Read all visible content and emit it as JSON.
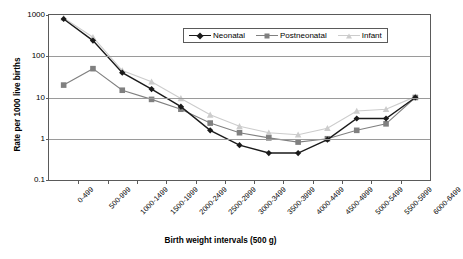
{
  "chart_data": {
    "type": "line",
    "title": "",
    "xlabel": "Birth weight intervals (500 g)",
    "ylabel": "Rate per 1000 live births",
    "yscale": "log",
    "ylim": [
      0.1,
      1000
    ],
    "yticks": [
      "1000",
      "100",
      "10",
      "1",
      "0.1"
    ],
    "ytick_values": [
      1000,
      100,
      10,
      1,
      0.1
    ],
    "grid": true,
    "legend_position": "top-center-inside",
    "categories": [
      "0-499",
      "500-999",
      "1000-1499",
      "1500-1999",
      "2000-2499",
      "2500-2999",
      "3000-3499",
      "3500-3999",
      "4000-4499",
      "4500-4999",
      "5000-5499",
      "5500-5999",
      "6000-6499"
    ],
    "series": [
      {
        "name": "Neonatal",
        "color": "#1a1a1a",
        "marker": "diamond",
        "values": [
          800,
          240,
          40,
          16,
          6.0,
          1.6,
          0.7,
          0.45,
          0.45,
          0.95,
          3.1,
          3.1,
          10
        ]
      },
      {
        "name": "Postneonatal",
        "color": "#808080",
        "marker": "square",
        "values": [
          20,
          50,
          15,
          9,
          5.2,
          2.4,
          1.4,
          1.05,
          0.83,
          1.0,
          1.6,
          2.3,
          10
        ]
      },
      {
        "name": "Infant",
        "color": "#cccccc",
        "marker": "triangle",
        "values": [
          850,
          290,
          45,
          24,
          9.5,
          3.8,
          2.0,
          1.4,
          1.25,
          1.8,
          4.7,
          5.2,
          10.5
        ]
      }
    ]
  },
  "axis_frame_color": "#5a5a5a",
  "gridline_color": "#9a9a9a",
  "background": "#ffffff"
}
